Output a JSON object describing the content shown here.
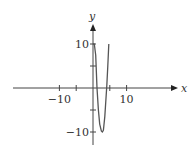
{
  "chart_data": {
    "type": "line",
    "title": "",
    "xlabel": "x",
    "ylabel": "y",
    "xlim": [
      -12,
      13
    ],
    "ylim": [
      -13,
      14
    ],
    "x_ticks": [
      -10,
      -5,
      0,
      5,
      10
    ],
    "y_ticks": [
      -10,
      -5,
      5,
      10
    ],
    "x_tick_labels": [
      {
        "value": -10,
        "label": "−10"
      },
      {
        "value": 10,
        "label": "10"
      }
    ],
    "y_tick_labels": [
      {
        "value": 10,
        "label": "10"
      },
      {
        "value": -10,
        "label": "−10"
      }
    ],
    "grid": false,
    "legend": null,
    "series": [
      {
        "name": "f(x)",
        "color": "#555555",
        "points": [
          [
            0.0,
            10
          ],
          [
            0.4,
            10
          ],
          [
            0.8,
            7.5
          ],
          [
            1.2,
            0
          ],
          [
            1.6,
            -5
          ],
          [
            2.0,
            -8.2
          ],
          [
            2.5,
            -9.8
          ],
          [
            2.8,
            -10
          ],
          [
            3.1,
            -9.6
          ],
          [
            3.5,
            -6.5
          ],
          [
            3.8,
            -3
          ],
          [
            4.1,
            0.5
          ],
          [
            4.4,
            5
          ],
          [
            4.7,
            10
          ]
        ]
      }
    ]
  },
  "colors": {
    "axis": "#444444",
    "curve": "#555555",
    "background": "#ffffff"
  }
}
